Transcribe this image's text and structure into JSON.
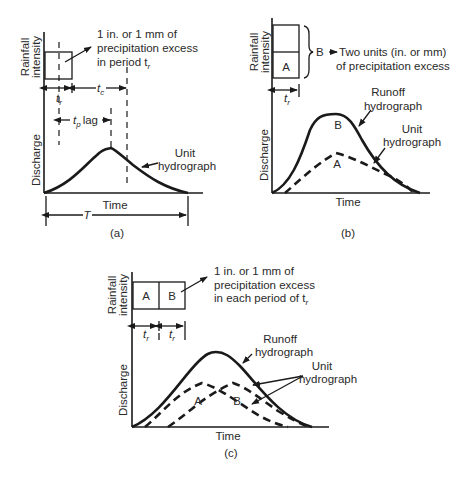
{
  "panel_a": {
    "caption": "(a)",
    "ylabel_top_1": "Rainfall",
    "ylabel_top_2": "intensity",
    "ylabel_bottom": "Discharge",
    "xlabel": "Time",
    "note_line1": "1 in. or 1 mm of",
    "note_line2": "precipitation excess",
    "note_line3": "in period t",
    "note_sub": "r",
    "tr": "t",
    "tr_sub": "r",
    "tc": "t",
    "tc_sub": "c",
    "tp": "t",
    "tp_sub": "p",
    "lag": "lag",
    "T": "T",
    "curve_label_1": "Unit",
    "curve_label_2": "hydrograph"
  },
  "panel_b": {
    "caption": "(b)",
    "ylabel_top_1": "Rainfall",
    "ylabel_top_2": "intensity",
    "ylabel_bottom": "Discharge",
    "xlabel": "Time",
    "block_a": "A",
    "block_b": "B",
    "note_line1": "Two units (in. or mm)",
    "note_line2": "of precipitation excess",
    "tr": "t",
    "tr_sub": "r",
    "runoff_1": "Runoff",
    "runoff_2": "hydrograph",
    "unit_1": "Unit",
    "unit_2": "hydrograph",
    "curve_b": "B",
    "curve_a": "A"
  },
  "panel_c": {
    "caption": "(c)",
    "ylabel_top_1": "Rainfall",
    "ylabel_top_2": "intensity",
    "ylabel_bottom": "Discharge",
    "xlabel": "Time",
    "block_a": "A",
    "block_b": "B",
    "note_line1": "1 in. or 1 mm of",
    "note_line2": "precipitation excess",
    "note_line3": "in each period of t",
    "note_sub": "r",
    "tr": "t",
    "tr_sub": "r",
    "runoff_1": "Runoff",
    "runoff_2": "hydrograph",
    "unit_1": "Unit",
    "unit_2": "hydrograph",
    "curve_a": "A",
    "curve_b": "B"
  }
}
